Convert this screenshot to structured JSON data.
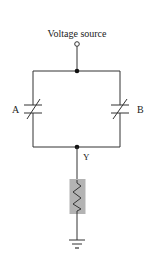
{
  "diagram": {
    "type": "circuit",
    "source_label": "Voltage source",
    "components": [
      {
        "id": "A",
        "kind": "variable-capacitor",
        "label": "A",
        "branch": "left"
      },
      {
        "id": "B",
        "kind": "variable-capacitor",
        "label": "B",
        "branch": "right"
      },
      {
        "id": "R",
        "kind": "resistor",
        "highlighted": true
      },
      {
        "id": "GND",
        "kind": "ground"
      }
    ],
    "nodes": [
      {
        "id": "top",
        "kind": "junction"
      },
      {
        "id": "Y",
        "kind": "junction",
        "label": "Y"
      }
    ],
    "colors": {
      "wire": "#333333",
      "resistor_highlight": "#b3b3b3"
    }
  }
}
